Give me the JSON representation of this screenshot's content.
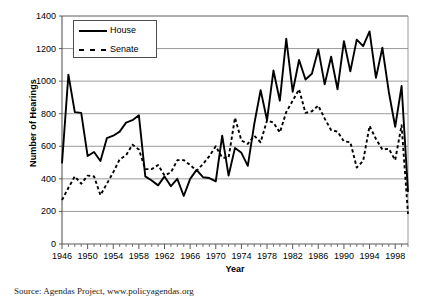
{
  "chart_data": {
    "type": "line",
    "title": "",
    "xlabel": "Year",
    "ylabel": "Number of Hearings",
    "xlim": [
      1946,
      2000
    ],
    "ylim": [
      0,
      1400
    ],
    "grid": true,
    "legend_position": "top-left",
    "ytick_labels": [
      "0",
      "200",
      "400",
      "600",
      "800",
      "1000",
      "1200",
      "1400"
    ],
    "ytick_values": [
      0,
      200,
      400,
      600,
      800,
      1000,
      1200,
      1400
    ],
    "xtick_labels": [
      "1946",
      "1950",
      "1954",
      "1958",
      "1962",
      "1966",
      "1970",
      "1974",
      "1978",
      "1982",
      "1986",
      "1990",
      "1994",
      "1998"
    ],
    "xtick_values": [
      1946,
      1950,
      1954,
      1958,
      1962,
      1966,
      1970,
      1974,
      1978,
      1982,
      1986,
      1990,
      1994,
      1998
    ],
    "minor_xticks": "every year",
    "x": [
      1946,
      1947,
      1948,
      1949,
      1950,
      1951,
      1952,
      1953,
      1954,
      1955,
      1956,
      1957,
      1958,
      1959,
      1960,
      1961,
      1962,
      1963,
      1964,
      1965,
      1966,
      1967,
      1968,
      1969,
      1970,
      1971,
      1972,
      1973,
      1974,
      1975,
      1976,
      1977,
      1978,
      1979,
      1980,
      1981,
      1982,
      1983,
      1984,
      1985,
      1986,
      1987,
      1988,
      1989,
      1990,
      1991,
      1992,
      1993,
      1994,
      1995,
      1996,
      1997,
      1998,
      1999,
      2000
    ],
    "series": [
      {
        "name": "House",
        "style": "solid",
        "color": "#000000",
        "values": [
          495,
          1040,
          810,
          805,
          540,
          565,
          510,
          650,
          665,
          690,
          745,
          760,
          790,
          415,
          390,
          360,
          415,
          355,
          400,
          295,
          400,
          455,
          410,
          405,
          385,
          665,
          420,
          590,
          560,
          480,
          735,
          945,
          760,
          1065,
          880,
          1260,
          935,
          1130,
          1010,
          1045,
          1195,
          980,
          1150,
          950,
          1245,
          1060,
          1255,
          1215,
          1305,
          1020,
          1205,
          935,
          720,
          970,
          320
        ]
      },
      {
        "name": "Senate",
        "style": "dashed",
        "color": "#000000",
        "values": [
          270,
          345,
          415,
          370,
          420,
          415,
          300,
          370,
          440,
          520,
          545,
          610,
          580,
          460,
          460,
          485,
          420,
          440,
          515,
          515,
          485,
          450,
          490,
          540,
          600,
          530,
          530,
          775,
          635,
          615,
          665,
          625,
          760,
          745,
          685,
          810,
          880,
          950,
          805,
          815,
          850,
          770,
          700,
          690,
          630,
          625,
          470,
          510,
          725,
          645,
          580,
          585,
          515,
          730,
          185
        ]
      }
    ]
  },
  "legend": {
    "entries": [
      {
        "label": "House",
        "style": "solid"
      },
      {
        "label": "Senate",
        "style": "dashed"
      }
    ]
  },
  "source_note": "Source: Agendas Project, www.policyagendas.org"
}
